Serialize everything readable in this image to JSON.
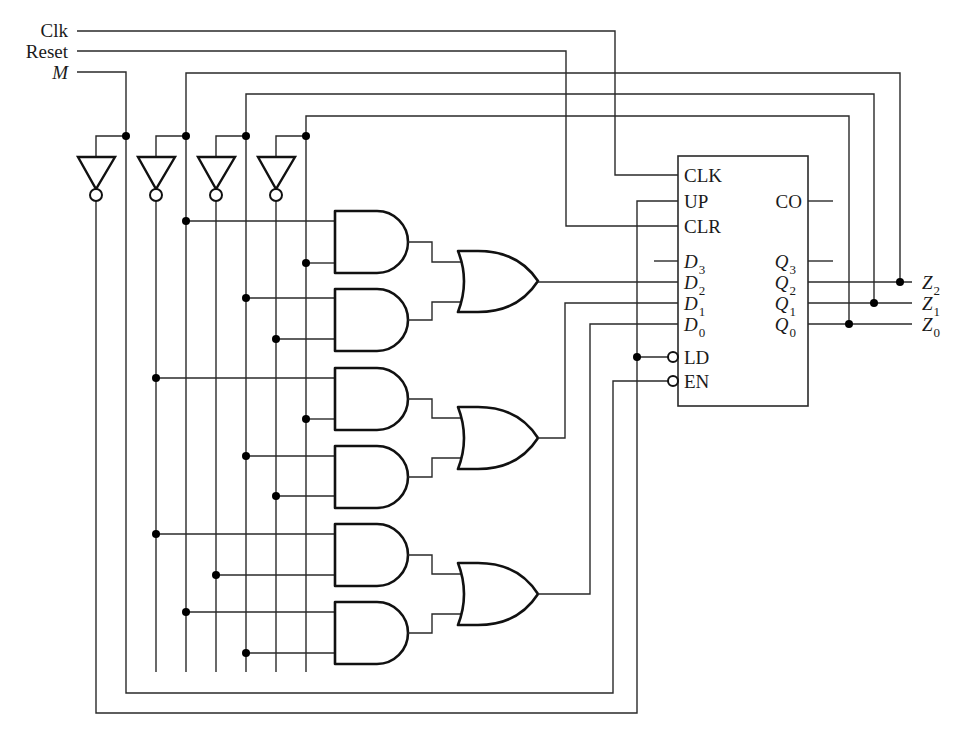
{
  "diagram": {
    "type": "logic-circuit",
    "inputs": [
      {
        "id": "clk",
        "label": "Clk",
        "italic": false
      },
      {
        "id": "reset",
        "label": "Reset",
        "italic": false
      },
      {
        "id": "m",
        "label": "M",
        "italic": true
      }
    ],
    "counter": {
      "left_pins": [
        {
          "id": "clk",
          "label": "CLK",
          "sub": ""
        },
        {
          "id": "up",
          "label": "UP",
          "sub": ""
        },
        {
          "id": "clr",
          "label": "CLR",
          "sub": ""
        },
        {
          "id": "d3",
          "label": "D",
          "sub": "3"
        },
        {
          "id": "d2",
          "label": "D",
          "sub": "2"
        },
        {
          "id": "d1",
          "label": "D",
          "sub": "1"
        },
        {
          "id": "d0",
          "label": "D",
          "sub": "0"
        },
        {
          "id": "ld",
          "label": "LD",
          "sub": "",
          "inverted": true
        },
        {
          "id": "en",
          "label": "EN",
          "sub": "",
          "inverted": true
        }
      ],
      "right_pins": [
        {
          "id": "co",
          "label": "CO",
          "sub": ""
        },
        {
          "id": "q3",
          "label": "Q",
          "sub": "3"
        },
        {
          "id": "q2",
          "label": "Q",
          "sub": "2"
        },
        {
          "id": "q1",
          "label": "Q",
          "sub": "1"
        },
        {
          "id": "q0",
          "label": "Q",
          "sub": "0"
        }
      ]
    },
    "outputs": [
      {
        "id": "z2",
        "label": "Z",
        "sub": "2"
      },
      {
        "id": "z1",
        "label": "Z",
        "sub": "1"
      },
      {
        "id": "z0",
        "label": "Z",
        "sub": "0"
      }
    ],
    "gates": {
      "inverters": 4,
      "and_gates": 6,
      "or_gates": 3
    },
    "colors": {
      "wire": "#2a2a2a",
      "gate": "#111111",
      "background": "#ffffff"
    }
  }
}
